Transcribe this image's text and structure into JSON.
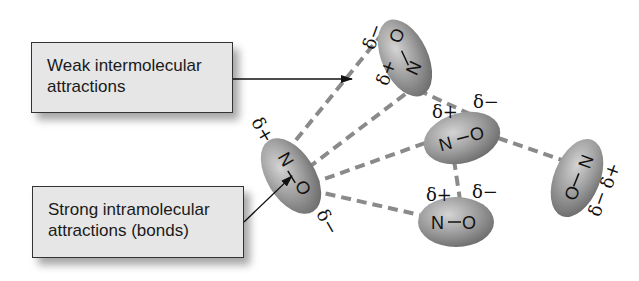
{
  "labels": {
    "weak": {
      "line1": "Weak intermolecular",
      "line2": "attractions"
    },
    "strong": {
      "line1": "Strong intramolecular",
      "line2": "attractions (bonds)"
    }
  },
  "molecules": [
    {
      "id": "top",
      "atom1": "O",
      "atom2": "N",
      "charge1": "δ−",
      "charge2": "δ+"
    },
    {
      "id": "left",
      "atom1": "N",
      "atom2": "O",
      "charge1": "δ+",
      "charge2": "δ−"
    },
    {
      "id": "middle",
      "atom1": "N",
      "atom2": "O",
      "charge1": "δ+",
      "charge2": "δ−"
    },
    {
      "id": "bottom",
      "atom1": "N",
      "atom2": "O",
      "charge1": "δ+",
      "charge2": "δ−"
    },
    {
      "id": "right",
      "atom1": "N",
      "atom2": "O",
      "charge1": "δ+",
      "charge2": "δ−"
    }
  ],
  "colors": {
    "box_fill": "#e6e6e6",
    "molecule_fill": "#9a9a9a",
    "dashed_line": "#8a8a8a",
    "text": "#111111"
  }
}
